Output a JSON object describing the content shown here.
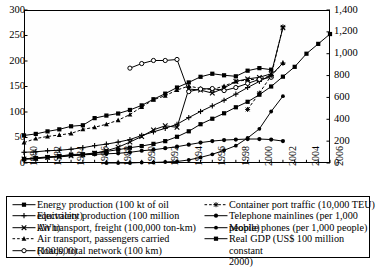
{
  "chart_data": {
    "type": "line",
    "title": "",
    "xlabel": "",
    "ylabel": "",
    "y2label": "",
    "x": [
      1980,
      1981,
      1982,
      1983,
      1984,
      1985,
      1986,
      1987,
      1988,
      1989,
      1990,
      1991,
      1992,
      1993,
      1994,
      1995,
      1996,
      1997,
      1998,
      1999,
      2000,
      2001,
      2002,
      2003,
      2004,
      2005,
      2006
    ],
    "xlim": [
      1980,
      2006
    ],
    "xticks": [
      "1980",
      "1982",
      "1984",
      "1986",
      "1988",
      "1990",
      "1992",
      "1994",
      "1996",
      "1998",
      "2000",
      "2002",
      "2004",
      "2006"
    ],
    "ylim": [
      0,
      300
    ],
    "yticks": [
      "0",
      "50",
      "100",
      "150",
      "200",
      "250",
      "300"
    ],
    "y2lim": [
      0,
      1400
    ],
    "y2ticks": [
      "0",
      "200",
      "400",
      "600",
      "800",
      "1,000",
      "1,200",
      "1,400"
    ],
    "grid": false,
    "legend_position": "bottom",
    "series": [
      {
        "name": "Energy production (100 kt of oil equivalent)",
        "axis": "left",
        "marker": "filled-square",
        "linestyle": "solid",
        "x": [
          1980,
          1981,
          1982,
          1983,
          1984,
          1985,
          1986,
          1987,
          1988,
          1989,
          1990,
          1991,
          1992,
          1993,
          1994,
          1995,
          1996,
          1997,
          1998,
          1999,
          2000,
          2001,
          2002
        ],
        "values": [
          54,
          57,
          62,
          66,
          72,
          74,
          88,
          93,
          97,
          104,
          113,
          125,
          136,
          148,
          158,
          169,
          175,
          172,
          170,
          181,
          186,
          183,
          null
        ]
      },
      {
        "name": "Electricity production (100 million kWh)",
        "axis": "left",
        "marker": "plus",
        "linestyle": "solid",
        "x": [
          1980,
          1981,
          1982,
          1983,
          1984,
          1985,
          1986,
          1987,
          1988,
          1989,
          1990,
          1991,
          1992,
          1993,
          1994,
          1995,
          1996,
          1997,
          1998,
          1999,
          2000,
          2001,
          2002
        ],
        "values": [
          21,
          22,
          24,
          25,
          27,
          30,
          34,
          37,
          41,
          46,
          54,
          61,
          68,
          76,
          89,
          101,
          112,
          123,
          135,
          148,
          160,
          172,
          196
        ]
      },
      {
        "name": "Air transport, freight (100,000 ton-km)",
        "axis": "left",
        "marker": "x-cross",
        "linestyle": "solid",
        "x": [
          1980,
          1981,
          1982,
          1983,
          1984,
          1985,
          1986,
          1987,
          1988,
          1989,
          1990,
          1991,
          1992,
          1993,
          1994,
          1995,
          1996,
          1997,
          1998,
          1999,
          2000,
          2001,
          2002
        ],
        "values": [
          8,
          9,
          11,
          12,
          14,
          16,
          19,
          24,
          31,
          41,
          52,
          65,
          73,
          70,
          145,
          143,
          137,
          147,
          160,
          165,
          168,
          175,
          265
        ]
      },
      {
        "name": "Air transport, passengers carried (100,000)",
        "axis": "left",
        "marker": "filled-triangle",
        "linestyle": "dashed",
        "x": [
          1980,
          1981,
          1982,
          1983,
          1984,
          1985,
          1986,
          1987,
          1988,
          1989,
          1990,
          1991,
          1992,
          1993,
          1994,
          1995,
          1996,
          1997,
          1998,
          1999,
          2000,
          2001,
          2002
        ],
        "values": [
          40,
          48,
          52,
          55,
          58,
          66,
          70,
          76,
          84,
          95,
          110,
          124,
          132,
          143,
          151,
          146,
          144,
          151,
          160,
          163,
          165,
          171,
          196
        ]
      },
      {
        "name": "Roads, total network (100 km)",
        "axis": "left",
        "marker": "open-circle",
        "linestyle": "solid",
        "x": [
          1989,
          1990,
          1991,
          1992,
          1993,
          1994,
          1995,
          1996,
          1997,
          1998,
          1999,
          2000,
          2001,
          2002
        ],
        "values": [
          186,
          195,
          201,
          201,
          203,
          140,
          145,
          146,
          142,
          148,
          156,
          164,
          168,
          null
        ]
      },
      {
        "name": "Container port traffic (10,000 TEU)",
        "axis": "left",
        "marker": "star",
        "linestyle": "dashed",
        "x": [
          1999,
          2000,
          2001,
          2002
        ],
        "values": [
          105,
          137,
          171,
          267
        ]
      },
      {
        "name": "Telephone mainlines (per 1,000 people)",
        "axis": "left",
        "marker": "filled-circle",
        "linestyle": "solid",
        "x": [
          1980,
          1981,
          1982,
          1983,
          1984,
          1985,
          1986,
          1987,
          1988,
          1989,
          1990,
          1991,
          1992,
          1993,
          1994,
          1995,
          1996,
          1997,
          1998,
          1999,
          2000,
          2001,
          2002
        ],
        "values": [
          8,
          10,
          12,
          13,
          15,
          16,
          17,
          18,
          19,
          21,
          24,
          26,
          29,
          32,
          36,
          40,
          43,
          45,
          46,
          47,
          47,
          46,
          43
        ]
      },
      {
        "name": "Mobile phones (per 1,000 people)",
        "axis": "left",
        "marker": "filled-hex",
        "linestyle": "solid",
        "x": [
          1987,
          1988,
          1989,
          1990,
          1991,
          1992,
          1993,
          1994,
          1995,
          1996,
          1997,
          1998,
          1999,
          2000,
          2001,
          2002
        ],
        "values": [
          0,
          0,
          0,
          1,
          1,
          2,
          3,
          6,
          11,
          17,
          25,
          34,
          49,
          67,
          101,
          131
        ]
      },
      {
        "name": "Real GDP (US$ 100 million constant 2000)",
        "axis": "right",
        "marker": "filled-square",
        "linestyle": "solid",
        "x": [
          1980,
          1981,
          1982,
          1983,
          1984,
          1985,
          1986,
          1987,
          1988,
          1989,
          1990,
          1991,
          1992,
          1993,
          1994,
          1995,
          1996,
          1997,
          1998,
          1999,
          2000,
          2001,
          2002,
          2003,
          2004,
          2005,
          2006
        ],
        "values": [
          35,
          40,
          50,
          62,
          78,
          80,
          92,
          106,
          122,
          140,
          155,
          175,
          200,
          240,
          290,
          355,
          405,
          455,
          510,
          560,
          625,
          700,
          790,
          880,
          1000,
          1090,
          1180
        ]
      }
    ]
  },
  "legend": {
    "left_items": [
      {
        "label": "Energy production (100 kt of oil equivalent)",
        "marker": "filled-square",
        "linestyle": "solid"
      },
      {
        "label": "Electricity production (100 million kWh)",
        "marker": "plus",
        "linestyle": "solid"
      },
      {
        "label": "Air transport, freight (100,000 ton-km)",
        "marker": "x-cross",
        "linestyle": "solid"
      },
      {
        "label": "Air transport, passengers carried (100,000)",
        "marker": "filled-triangle",
        "linestyle": "dashed"
      },
      {
        "label": "Roads, total network (100 km)",
        "marker": "open-circle",
        "linestyle": "solid"
      }
    ],
    "right_items": [
      {
        "label": "Container port traffic (10,000 TEU)",
        "marker": "star",
        "linestyle": "dashed"
      },
      {
        "label": "Telephone mainlines (per 1,000 people)",
        "marker": "filled-circle",
        "linestyle": "solid"
      },
      {
        "label": "Mobile phones (per 1,000 people)",
        "marker": "filled-hex",
        "linestyle": "solid"
      },
      {
        "label": "Real GDP (US$ 100 million constant 2000)",
        "marker": "filled-square",
        "linestyle": "solid",
        "line2": "2000)"
      }
    ]
  },
  "colors": {
    "line": "#000000",
    "axis": "#000000",
    "background": "#ffffff"
  },
  "bottom_caption": ""
}
